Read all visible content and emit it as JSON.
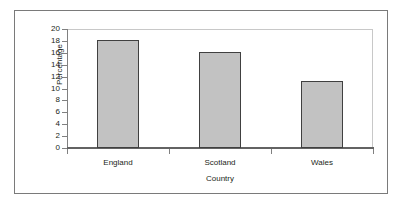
{
  "chart_data": {
    "type": "bar",
    "title": "",
    "xlabel": "Country",
    "ylabel": "Percentage",
    "categories": [
      "England",
      "Scotland",
      "Wales"
    ],
    "values": [
      18.1,
      16.1,
      11.3
    ],
    "ylim": [
      0,
      20
    ],
    "ytick_labels": [
      "20",
      "18",
      "16",
      "14",
      "12",
      "10",
      "8",
      "6",
      "4",
      "2",
      "0"
    ],
    "ytick_values": [
      20,
      18,
      16,
      14,
      12,
      10,
      8,
      6,
      4,
      2,
      0
    ],
    "ytick_step": 2,
    "grid": false,
    "legend": null,
    "legend_position": "none",
    "series": [
      {
        "name": "Percentage",
        "values": [
          18.1,
          16.1,
          11.3
        ]
      }
    ],
    "colors": {
      "bar_fill": "#c2c2c2",
      "bar_border": "#404040",
      "axis_line": "#636363",
      "plot_border": "#c8c8c8",
      "frame": "#7a7a7a",
      "text": "#231f20",
      "background": "#ffffff"
    }
  }
}
